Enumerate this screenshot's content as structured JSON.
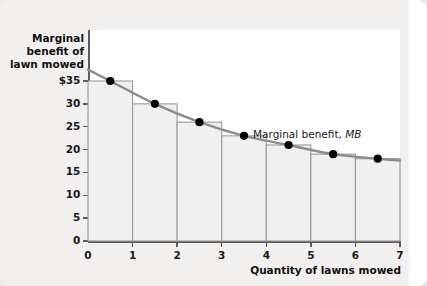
{
  "chart_data": {
    "type": "bar",
    "title": "",
    "xlabel": "Quantity of lawns mowed",
    "ylabel": "Marginal benefit of lawn mowed",
    "categories": [
      "1",
      "2",
      "3",
      "4",
      "5",
      "6",
      "7"
    ],
    "values": [
      35,
      30,
      26,
      23,
      21,
      19,
      18
    ],
    "series": [
      {
        "name": "Marginal benefit, MB",
        "x": [
          0.5,
          1.5,
          2.5,
          3.5,
          4.5,
          5.5,
          6.5
        ],
        "values": [
          35,
          30,
          26,
          23,
          21,
          19,
          18
        ]
      }
    ],
    "xlim": [
      0,
      7
    ],
    "ylim": [
      0,
      38
    ],
    "xticks": [
      "0",
      "1",
      "2",
      "3",
      "4",
      "5",
      "6",
      "7"
    ],
    "yticks": [
      "$35",
      "30",
      "25",
      "20",
      "15",
      "10",
      "5",
      "0"
    ],
    "ytick_values": [
      35,
      30,
      25,
      20,
      15,
      10,
      5,
      0
    ],
    "grid": false,
    "legend": "none",
    "annotations": [
      {
        "text": "Marginal benefit, MB",
        "emphasis": "MB",
        "x": 5.1,
        "y": 22.5
      }
    ],
    "colors": {
      "curve": "#8c8c8c",
      "point": "#000000",
      "bar_fill": "#f0f0f0",
      "bar_stroke": "#9a9a9a",
      "axis": "#5a5a5a",
      "plot_background": "#ffffff",
      "page_background": "#f1f0ee"
    }
  },
  "axes": {
    "y_title_lines": [
      "Marginal",
      "benefit of",
      "lawn mowed"
    ],
    "x_title": "Quantity of lawns mowed"
  },
  "curve": {
    "label_prefix": "Marginal benefit, ",
    "label_italic": "MB"
  }
}
